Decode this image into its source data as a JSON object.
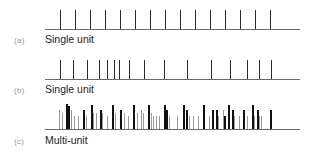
{
  "panels": [
    {
      "id": "a",
      "tag": "(a)",
      "label": "Single unit",
      "baseline_y": 29,
      "line_x": [
        45,
        300
      ],
      "spike_top": 10,
      "color": "#2a2a2a",
      "spikes_x": [
        60,
        75,
        90,
        105,
        120,
        135,
        150,
        165,
        180,
        195,
        210,
        225,
        240,
        255,
        270
      ]
    },
    {
      "id": "b",
      "tag": "(b)",
      "label": "Single unit",
      "baseline_y": 79,
      "line_x": [
        45,
        300
      ],
      "spike_top": 60,
      "color": "#2a2a2a",
      "spikes_x": [
        60,
        73,
        87,
        99,
        107,
        114,
        119,
        129,
        144,
        164,
        187,
        211,
        230,
        247,
        259,
        271
      ]
    },
    {
      "id": "c",
      "tag": "(c)",
      "label": "Multi-unit",
      "baseline_y": 129,
      "line_x": [
        45,
        300
      ],
      "spikes": [
        {
          "x": 59,
          "top": 110,
          "c": "g"
        },
        {
          "x": 62,
          "top": 113,
          "c": "g"
        },
        {
          "x": 66,
          "top": 104,
          "c": "k"
        },
        {
          "x": 68,
          "top": 106,
          "c": "k"
        },
        {
          "x": 71,
          "top": 110,
          "c": "g"
        },
        {
          "x": 74,
          "top": 116,
          "c": "g"
        },
        {
          "x": 78,
          "top": 116,
          "c": "g"
        },
        {
          "x": 83,
          "top": 110,
          "c": "k"
        },
        {
          "x": 86,
          "top": 116,
          "c": "g"
        },
        {
          "x": 91,
          "top": 105,
          "c": "k"
        },
        {
          "x": 93,
          "top": 113,
          "c": "g"
        },
        {
          "x": 96,
          "top": 113,
          "c": "g"
        },
        {
          "x": 100,
          "top": 110,
          "c": "k"
        },
        {
          "x": 102,
          "top": 113,
          "c": "g"
        },
        {
          "x": 107,
          "top": 116,
          "c": "g"
        },
        {
          "x": 112,
          "top": 105,
          "c": "k"
        },
        {
          "x": 115,
          "top": 113,
          "c": "g"
        },
        {
          "x": 120,
          "top": 110,
          "c": "k"
        },
        {
          "x": 124,
          "top": 113,
          "c": "g"
        },
        {
          "x": 128,
          "top": 116,
          "c": "g"
        },
        {
          "x": 133,
          "top": 105,
          "c": "k"
        },
        {
          "x": 137,
          "top": 113,
          "c": "g"
        },
        {
          "x": 141,
          "top": 110,
          "c": "g"
        },
        {
          "x": 143,
          "top": 113,
          "c": "g"
        },
        {
          "x": 148,
          "top": 105,
          "c": "k"
        },
        {
          "x": 151,
          "top": 113,
          "c": "g"
        },
        {
          "x": 153,
          "top": 116,
          "c": "g"
        },
        {
          "x": 156,
          "top": 116,
          "c": "g"
        },
        {
          "x": 159,
          "top": 116,
          "c": "g"
        },
        {
          "x": 164,
          "top": 105,
          "c": "k"
        },
        {
          "x": 166,
          "top": 110,
          "c": "k"
        },
        {
          "x": 169,
          "top": 116,
          "c": "g"
        },
        {
          "x": 177,
          "top": 116,
          "c": "g"
        },
        {
          "x": 183,
          "top": 105,
          "c": "k"
        },
        {
          "x": 186,
          "top": 110,
          "c": "k"
        },
        {
          "x": 189,
          "top": 116,
          "c": "g"
        },
        {
          "x": 193,
          "top": 116,
          "c": "g"
        },
        {
          "x": 198,
          "top": 116,
          "c": "g"
        },
        {
          "x": 203,
          "top": 105,
          "c": "k"
        },
        {
          "x": 209,
          "top": 116,
          "c": "g"
        },
        {
          "x": 212,
          "top": 110,
          "c": "k"
        },
        {
          "x": 216,
          "top": 110,
          "c": "k"
        },
        {
          "x": 218,
          "top": 116,
          "c": "g"
        },
        {
          "x": 223,
          "top": 110,
          "c": "g"
        },
        {
          "x": 224,
          "top": 116,
          "c": "k"
        },
        {
          "x": 228,
          "top": 105,
          "c": "k"
        },
        {
          "x": 232,
          "top": 110,
          "c": "k"
        },
        {
          "x": 234,
          "top": 116,
          "c": "g"
        },
        {
          "x": 239,
          "top": 116,
          "c": "g"
        },
        {
          "x": 243,
          "top": 110,
          "c": "k"
        },
        {
          "x": 247,
          "top": 116,
          "c": "g"
        },
        {
          "x": 252,
          "top": 105,
          "c": "k"
        },
        {
          "x": 254,
          "top": 116,
          "c": "g"
        },
        {
          "x": 257,
          "top": 110,
          "c": "k"
        },
        {
          "x": 259,
          "top": 116,
          "c": "g"
        },
        {
          "x": 261,
          "top": 116,
          "c": "g"
        },
        {
          "x": 270,
          "top": 110,
          "c": "k"
        }
      ],
      "colors": {
        "k": "#111111",
        "g": "#9a9a9a"
      }
    }
  ]
}
